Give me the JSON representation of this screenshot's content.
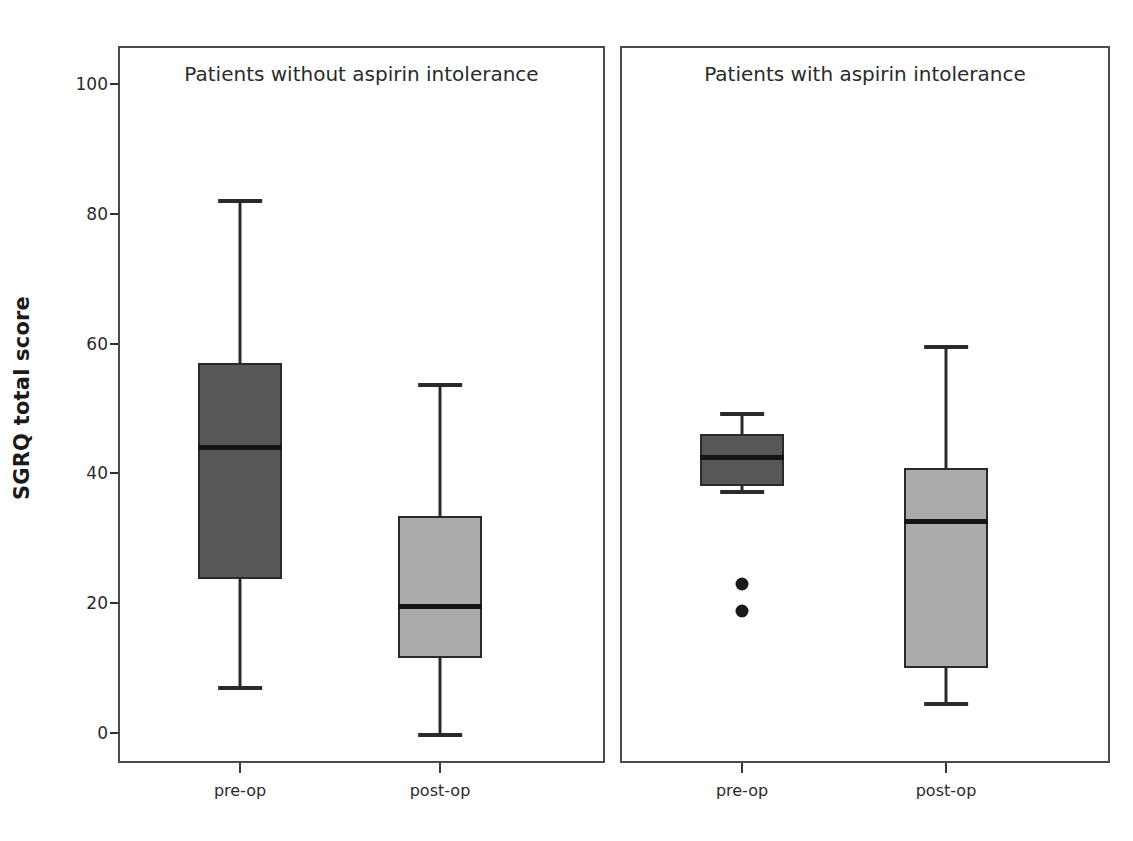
{
  "chart_data": {
    "type": "box",
    "title": "",
    "xlabel": "",
    "ylabel": "SGRQ total score",
    "ylim": [
      -5,
      105
    ],
    "yticks": [
      0,
      20,
      40,
      60,
      80,
      100
    ],
    "ytick_labels": [
      "0",
      "20",
      "40",
      "60",
      "80",
      "100"
    ],
    "grid": false,
    "legend": null,
    "panels": [
      {
        "title": "Patients without aspirin intolerance",
        "categories": [
          "pre-op",
          "post-op"
        ],
        "boxes": [
          {
            "category": "pre-op",
            "fill": "#575757",
            "whisker_low": 7.2,
            "q1": 23.8,
            "median": 44.0,
            "q3": 57.0,
            "whisker_high": 82.3,
            "outliers": []
          },
          {
            "category": "post-op",
            "fill": "#ababab",
            "whisker_low": 0.0,
            "q1": 11.5,
            "median": 19.5,
            "q3": 33.4,
            "whisker_high": 54.0,
            "outliers": []
          }
        ]
      },
      {
        "title": "Patients with aspirin intolerance",
        "categories": [
          "pre-op",
          "post-op"
        ],
        "boxes": [
          {
            "category": "pre-op",
            "fill": "#575757",
            "whisker_low": 37.5,
            "q1": 38.0,
            "median": 42.5,
            "q3": 46.0,
            "whisker_high": 49.5,
            "outliers": [
              23.0,
              18.8
            ]
          },
          {
            "category": "post-op",
            "fill": "#ababab",
            "whisker_low": 4.7,
            "q1": 10.0,
            "median": 32.7,
            "q3": 40.8,
            "whisker_high": 59.8,
            "outliers": []
          }
        ]
      }
    ]
  },
  "geometry": {
    "y_zero_px": 733,
    "y_hundred_px": 84,
    "panels": [
      {
        "left": 118,
        "top": 46,
        "width": 487,
        "height": 717,
        "centers": [
          240,
          440
        ],
        "box_width": 84
      },
      {
        "left": 620,
        "top": 46,
        "width": 490,
        "height": 717,
        "centers": [
          742,
          946
        ],
        "box_width": 84
      }
    ],
    "ytick_label_right_px": 108,
    "ytick_mark_left_px": 110
  }
}
